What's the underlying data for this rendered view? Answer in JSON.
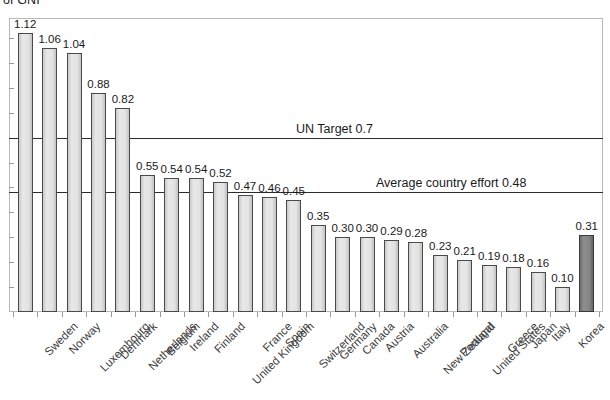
{
  "chart_data": {
    "type": "bar",
    "title": "of GNI",
    "subtitle": "",
    "xlabel": "",
    "ylabel": "",
    "ylim": [
      0,
      1.18
    ],
    "grid": false,
    "legend": "none",
    "categories": [
      "Sweden",
      "Norway",
      "Luxembourg",
      "Denmark",
      "Netherlands",
      "Belgium",
      "Ireland",
      "Finland",
      "United Kingdom",
      "France",
      "Spain",
      "Switzerland",
      "Germany",
      "Canada",
      "Austria",
      "Australia",
      "New Zealand",
      "Portugal",
      "United States",
      "Greece",
      "Japan",
      "Italy",
      "Korea",
      "TOTAL DAC"
    ],
    "values": [
      1.12,
      1.06,
      1.04,
      0.88,
      0.82,
      0.55,
      0.54,
      0.54,
      0.52,
      0.47,
      0.46,
      0.45,
      0.35,
      0.3,
      0.3,
      0.29,
      0.28,
      0.23,
      0.21,
      0.19,
      0.18,
      0.16,
      0.1,
      0.31
    ],
    "value_labels": [
      "1.12",
      "1.06",
      "1.04",
      "0.88",
      "0.82",
      "0.55",
      "0.54",
      "0.54",
      "0.52",
      "0.47",
      "0.46",
      "0.45",
      "0.35",
      "0.30",
      "0.30",
      "0.29",
      "0.28",
      "0.23",
      "0.21",
      "0.19",
      "0.18",
      "0.16",
      "0.10",
      "0.31"
    ],
    "highlight_index": 23,
    "bar_color": "#e0e0e0",
    "bar_border_color": "#4a4a4a",
    "highlight_color": "#848484",
    "reference_lines": [
      {
        "label": "UN Target 0.7",
        "value": 0.7,
        "color": "#2b2b2b"
      },
      {
        "label": "Average country effort 0.48",
        "value": 0.48,
        "color": "#2b2b2b"
      }
    ]
  }
}
